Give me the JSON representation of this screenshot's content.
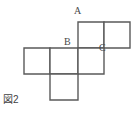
{
  "figure": {
    "caption": "図2",
    "line_color": "#5a5a5a",
    "fill_color": "#ffffff",
    "background_color": "#ffffff",
    "cell_size_px": 26,
    "labels": [
      {
        "id": "A",
        "text": "A",
        "x": 78,
        "y": 22
      },
      {
        "id": "B",
        "text": "B",
        "x": 78,
        "y": 48
      },
      {
        "id": "C",
        "text": "C",
        "x": 104,
        "y": 48
      }
    ],
    "squares": [
      {
        "name": "top-left-square",
        "x": 78,
        "y": 22,
        "w": 26,
        "h": 26
      },
      {
        "name": "top-right-square",
        "x": 104,
        "y": 22,
        "w": 26,
        "h": 26
      },
      {
        "name": "middle-left-square",
        "x": 24,
        "y": 48,
        "w": 26,
        "h": 26
      },
      {
        "name": "middle-center-square",
        "x": 50,
        "y": 48,
        "w": 28,
        "h": 26
      },
      {
        "name": "middle-right-square",
        "x": 78,
        "y": 48,
        "w": 26,
        "h": 26
      },
      {
        "name": "bottom-square",
        "x": 50,
        "y": 74,
        "w": 28,
        "h": 26
      }
    ]
  }
}
